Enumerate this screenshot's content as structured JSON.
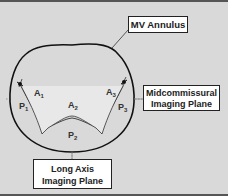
{
  "labels": {
    "annulus": "MV Annulus",
    "midcommissural_line1": "Midcommissural",
    "midcommissural_line2": "Imaging Plane",
    "long_axis_line1": "Long Axis",
    "long_axis_line2": "Imaging Plane"
  },
  "segments": {
    "A1": {
      "letter": "A",
      "sub": "1"
    },
    "A2": {
      "letter": "A",
      "sub": "2"
    },
    "A3": {
      "letter": "A",
      "sub": "3"
    },
    "P1": {
      "letter": "P",
      "sub": "1"
    },
    "P2": {
      "letter": "P",
      "sub": "2"
    },
    "P3": {
      "letter": "P",
      "sub": "3"
    }
  },
  "colors": {
    "background": "#d9d9d9",
    "annulus_stroke": "#111111",
    "plane_line": "#888888",
    "leaflet_fill": "#e8e8e8"
  }
}
